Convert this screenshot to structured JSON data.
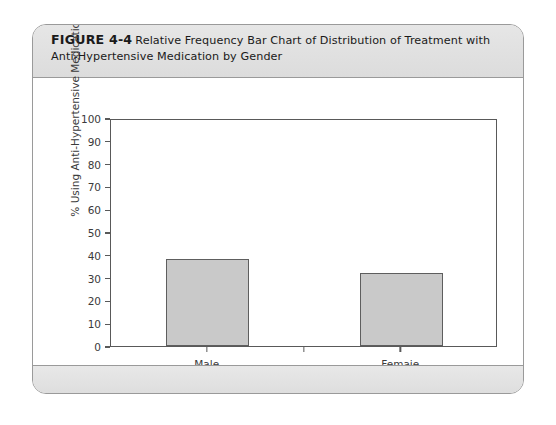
{
  "figure": {
    "label": "FIGURE 4-4",
    "caption": "Relative Frequency Bar Chart of Distribution of Treatment with Anti-Hypertensive Medication by Gender"
  },
  "chart_data": {
    "type": "bar",
    "title": "Relative Frequency Bar Chart of Distribution of Treatment with Anti-Hypertensive Medication by Gender",
    "categories": [
      "Male",
      "Femaie"
    ],
    "values": [
      38,
      32
    ],
    "xlabel": "Gender",
    "ylabel": "% Using Anti-Hypertensive Medication",
    "ylim": [
      0,
      100
    ],
    "yticks": [
      0,
      10,
      20,
      30,
      40,
      50,
      60,
      70,
      80,
      90,
      100
    ],
    "ytick_labels": [
      "0",
      "10",
      "20",
      "30",
      "40",
      "50",
      "60",
      "70",
      "80",
      "90",
      "100"
    ],
    "grid": false,
    "legend": false,
    "bar_fill_color": "#c9c9c9",
    "bar_edge_color": "#5e5e5e",
    "axis_color": "#595959"
  }
}
